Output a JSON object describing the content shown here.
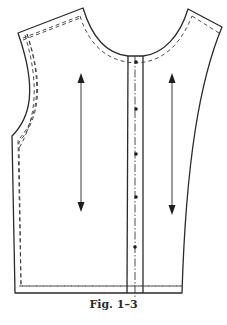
{
  "figure": {
    "caption": "Fig. 1–3",
    "elements": {
      "cutting_line": "solid outline",
      "seam_allowance_line": "dashed",
      "center_front_line": "dash-dot",
      "grainline_arrows": 2,
      "button_markings": 5
    },
    "colors": {
      "line": "#2a2a2a",
      "background": "#ffffff"
    }
  }
}
